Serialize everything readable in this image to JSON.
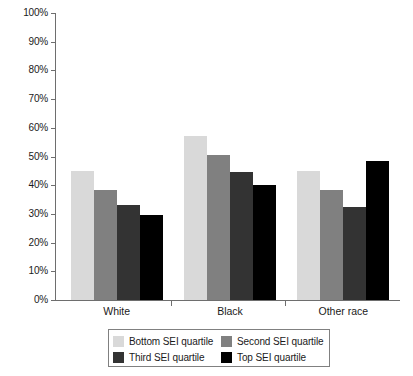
{
  "chart_data": {
    "type": "bar",
    "title": "",
    "subtitle": "",
    "xlabel": "",
    "ylabel": "",
    "categories": [
      "White",
      "Black",
      "Other race"
    ],
    "series": [
      {
        "name": "Bottom SEI quartile",
        "color": "#d9d9d9",
        "values": [
          45,
          57,
          45
        ]
      },
      {
        "name": "Second SEI quartile",
        "color": "#808080",
        "values": [
          38.5,
          50.5,
          38.5
        ]
      },
      {
        "name": "Third SEI quartile",
        "color": "#333333",
        "values": [
          33,
          44.5,
          32.5
        ]
      },
      {
        "name": "Top SEI quartile",
        "color": "#000000",
        "values": [
          29.5,
          40,
          48.5
        ]
      }
    ],
    "ylim": [
      0,
      100
    ],
    "ytick_values": [
      0,
      10,
      20,
      30,
      40,
      50,
      60,
      70,
      80,
      90,
      100
    ],
    "ytick_labels": [
      "0%",
      "10%",
      "20%",
      "30%",
      "40%",
      "50%",
      "60%",
      "70%",
      "80%",
      "90%",
      "100%"
    ],
    "grid": false,
    "legend_position": "bottom",
    "value_format": "percent"
  },
  "axes": {
    "y_ticks": [
      "100%",
      "90%",
      "80%",
      "70%",
      "60%",
      "50%",
      "40%",
      "30%",
      "20%",
      "10%",
      "0%"
    ],
    "x_ticks": [
      "White",
      "Black",
      "Other race"
    ]
  },
  "legend": {
    "entries": [
      {
        "label": "Bottom SEI quartile",
        "color": "#d9d9d9"
      },
      {
        "label": "Second SEI quartile",
        "color": "#808080"
      },
      {
        "label": "Third SEI quartile",
        "color": "#333333"
      },
      {
        "label": "Top SEI quartile",
        "color": "#000000"
      }
    ]
  }
}
